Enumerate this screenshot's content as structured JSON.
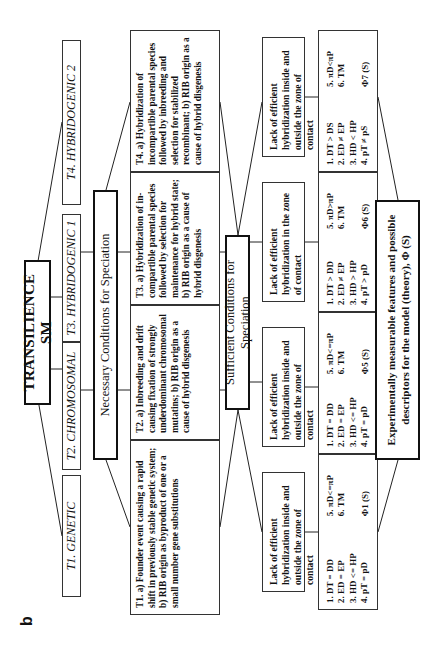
{
  "panel_label": "b",
  "root": {
    "title": "TRANSILIENCE SM"
  },
  "types": [
    {
      "label": "T1. GENETIC"
    },
    {
      "label": "T2. CHROMOSOMAL"
    },
    {
      "label": "T3. HYBRIDOGENIC 1"
    },
    {
      "label": "T4. HYBRIDOGENIC 2"
    }
  ],
  "necessary": {
    "header": "Necessary Conditions for Speciation",
    "items": [
      {
        "text": "T1. a) Founder event causing a rapid shift in previously stable genetic system; b) RIB origin as byproduct of one or a small number gene substitutions"
      },
      {
        "text": "T2. a) Inbreeding and drift causing fixation of strongly underdominant chromosomal mutatins; b) RIB origin as a cause of hybrid disgenesis"
      },
      {
        "text": "T3. a) Hybridization of in-compartible parental species followed by selection for maintenance for hybrid state; b) RIB origin as a cause of hybrid disgenesis"
      },
      {
        "text": "T4. a) Hybridization of incompartible parental species followed by inbreeding and selection for stabilized recombinant; b) RIB origin as a cause of hybrid disgenesis"
      }
    ]
  },
  "sufficient": {
    "header": "Sufficient Conditions for Speciation",
    "items": [
      {
        "text": "Lack of efficient hybridization inside and outside the zone of contact"
      },
      {
        "text": "Lack of efficient hybridization inside and outside the zone of contact"
      },
      {
        "text": "Lack of efficient hybridization in the zone of contact"
      },
      {
        "text": "Lack of efficient hybridization inside and outside the zone of contact"
      }
    ]
  },
  "criteria": [
    {
      "left": [
        "1. DT = DD",
        "2. ED = EP",
        "3. HD <= HP",
        "4. pT = pD"
      ],
      "right": [
        "5. πD<=πP",
        "6. TM"
      ],
      "phi": "Φ1 (S)"
    },
    {
      "left": [
        "1. DT = DD",
        "2. ED = EP",
        "3. HD <= HP",
        "4. pT = pD"
      ],
      "right": [
        "5. πD<=πP",
        "6. TM"
      ],
      "phi": "Φ5 (S)"
    },
    {
      "left": [
        "1. DT > DD",
        "2. ED ≠ EP",
        "3. HD > HP",
        "4. pT > pD"
      ],
      "right": [
        "5. πD>πP",
        "6. TM"
      ],
      "phi": "Φ6 (S)"
    },
    {
      "left": [
        "1. DT > DS",
        "2. ED ≠ EP",
        "3. HD < HP",
        "4. pT ≠ pS"
      ],
      "right": [
        "5. πD<πP",
        "6. TM"
      ],
      "phi": "Φ7 (S)"
    }
  ],
  "outcome": {
    "text": "Experimentally measurable features and possible descriptors for the model (theory), Φ (S)"
  }
}
